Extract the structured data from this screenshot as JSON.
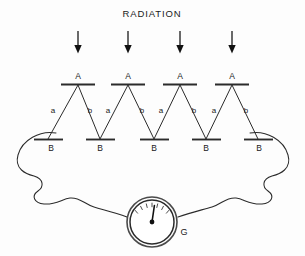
{
  "figure": {
    "title": "RADIATION",
    "background_color": "#fdfdfd",
    "ink_color": "#2b2b2b"
  },
  "arrows": [
    {
      "label": "radiation-arrow-1",
      "x": 78,
      "y_top": 31,
      "y_bottom": 52
    },
    {
      "label": "radiation-arrow-2",
      "x": 128,
      "y_top": 31,
      "y_bottom": 52
    },
    {
      "label": "radiation-arrow-3",
      "x": 180,
      "y_top": 31,
      "y_bottom": 52
    },
    {
      "label": "radiation-arrow-4",
      "x": 232,
      "y_top": 31,
      "y_bottom": 52
    }
  ],
  "hot_junctions": [
    {
      "name": "A",
      "x": 78,
      "y": 84
    },
    {
      "name": "A",
      "x": 128,
      "y": 84
    },
    {
      "name": "A",
      "x": 180,
      "y": 84
    },
    {
      "name": "A",
      "x": 232,
      "y": 84
    }
  ],
  "cold_junctions": [
    {
      "name": "B",
      "x": 48,
      "y": 140
    },
    {
      "name": "B",
      "x": 100,
      "y": 140
    },
    {
      "name": "B",
      "x": 154,
      "y": 140
    },
    {
      "name": "B",
      "x": 206,
      "y": 140
    },
    {
      "name": "B",
      "x": 258,
      "y": 140
    }
  ],
  "leg_labels": [
    {
      "name": "a",
      "x": 53,
      "y": 110
    },
    {
      "name": "b",
      "x": 90,
      "y": 110
    },
    {
      "name": "a",
      "x": 108,
      "y": 110
    },
    {
      "name": "b",
      "x": 142,
      "y": 110
    },
    {
      "name": "a",
      "x": 161,
      "y": 110
    },
    {
      "name": "b",
      "x": 194,
      "y": 110
    },
    {
      "name": "a",
      "x": 214,
      "y": 110
    },
    {
      "name": "b",
      "x": 246,
      "y": 110
    }
  ],
  "galvanometer": {
    "label": "G",
    "center_x": 152,
    "center_y": 222,
    "outer_radius": 25,
    "inner_radius": 22,
    "needle_angle_deg": 8,
    "tick_count": 7,
    "label_x": 184,
    "label_y": 235
  },
  "legend_semantics": {
    "title_meaning": "incident radiation onto hot junctions",
    "A_meaning": "hot junction",
    "B_meaning": "cold junction",
    "a_meaning": "thermoelement leg a",
    "b_meaning": "thermoelement leg b",
    "G_meaning": "galvanometer"
  }
}
